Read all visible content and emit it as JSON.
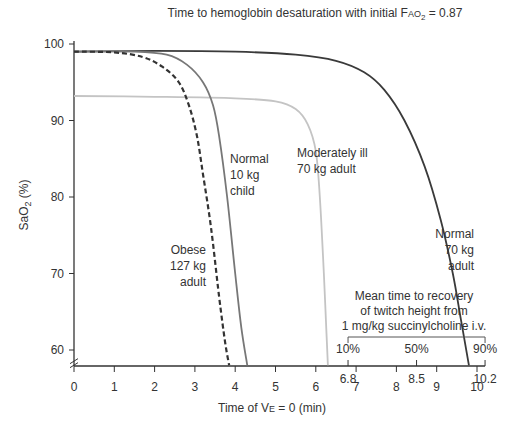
{
  "chart_data": {
    "type": "line",
    "title": "Time to hemoglobin desaturation with initial F",
    "title_sub_main": "AO",
    "title_subscript": "2",
    "title_tail": " = 0.87",
    "xlabel_pre": "Time of V",
    "xlabel_sub": "E",
    "xlabel_post": " = 0 (min)",
    "ylabel_main": "SaO",
    "ylabel_sub": "2",
    "ylabel_post": " (%)",
    "xlim": [
      0,
      10.2
    ],
    "ylim": [
      58,
      100
    ],
    "x_ticks": [
      0,
      1,
      2,
      3,
      4,
      5,
      6,
      7,
      8,
      9,
      10
    ],
    "x_tick_labels": [
      "0",
      "1",
      "2",
      "3",
      "4",
      "5",
      "6",
      "7",
      "8",
      "9",
      "10"
    ],
    "y_ticks": [
      60,
      70,
      80,
      90,
      100
    ],
    "y_tick_labels": [
      "60",
      "70",
      "80",
      "90",
      "100"
    ],
    "extra_x_labels": [
      {
        "x": 6.8,
        "label": "6.8"
      },
      {
        "x": 8.5,
        "label": "8.5"
      },
      {
        "x": 10.2,
        "label": "10.2"
      }
    ],
    "series": [
      {
        "name": "Normal 70 kg adult",
        "style": "solid",
        "color": "#3a3a3a",
        "points": [
          [
            0,
            99
          ],
          [
            2,
            99.1
          ],
          [
            4,
            99
          ],
          [
            5.5,
            98.6
          ],
          [
            6.5,
            97.8
          ],
          [
            7.2,
            96.3
          ],
          [
            7.7,
            94
          ],
          [
            8.2,
            90
          ],
          [
            8.7,
            84
          ],
          [
            9.1,
            77
          ],
          [
            9.4,
            70
          ],
          [
            9.6,
            64
          ],
          [
            9.8,
            58
          ]
        ]
      },
      {
        "name": "Moderately ill 70 kg adult",
        "style": "solid",
        "color": "#c4c4c4",
        "points": [
          [
            0,
            93.2
          ],
          [
            2,
            93.1
          ],
          [
            4,
            92.9
          ],
          [
            5,
            92.5
          ],
          [
            5.5,
            91.5
          ],
          [
            5.8,
            89.5
          ],
          [
            6.0,
            86
          ],
          [
            6.1,
            80
          ],
          [
            6.2,
            70
          ],
          [
            6.25,
            64
          ],
          [
            6.3,
            58
          ]
        ]
      },
      {
        "name": "Normal 10 kg child",
        "style": "solid",
        "color": "#777777",
        "points": [
          [
            0,
            99
          ],
          [
            1.5,
            99
          ],
          [
            2.3,
            98.6
          ],
          [
            2.8,
            97.3
          ],
          [
            3.2,
            95
          ],
          [
            3.45,
            92
          ],
          [
            3.6,
            88
          ],
          [
            3.8,
            80
          ],
          [
            4.0,
            70
          ],
          [
            4.15,
            63
          ],
          [
            4.3,
            58
          ]
        ]
      },
      {
        "name": "Obese 127 kg adult",
        "style": "dashed",
        "color": "#333333",
        "points": [
          [
            0,
            99
          ],
          [
            1,
            98.9
          ],
          [
            1.7,
            98.3
          ],
          [
            2.2,
            97
          ],
          [
            2.6,
            95
          ],
          [
            2.85,
            92
          ],
          [
            3.05,
            88
          ],
          [
            3.2,
            83
          ],
          [
            3.4,
            76
          ],
          [
            3.6,
            67
          ],
          [
            3.75,
            61
          ],
          [
            3.85,
            58
          ]
        ]
      }
    ],
    "series_labels": [
      {
        "lines": [
          "Normal",
          "70 kg",
          "adult"
        ],
        "anchor": "end"
      },
      {
        "lines": [
          "Moderately ill",
          "70 kg adult"
        ],
        "anchor": "start"
      },
      {
        "lines": [
          "Normal",
          "10 kg",
          "child"
        ],
        "anchor": "start"
      },
      {
        "lines": [
          "Obese",
          "127 kg",
          "adult"
        ],
        "anchor": "end"
      }
    ],
    "annotation": {
      "lines": [
        "Mean time to recovery",
        "of twitch height from",
        "1 mg/kg succinylcholine i.v."
      ],
      "bracket_labels": [
        "10%",
        "50%",
        "90%"
      ],
      "bracket_x": [
        6.8,
        8.5,
        10.2
      ]
    },
    "grid": false,
    "legend": "none"
  }
}
